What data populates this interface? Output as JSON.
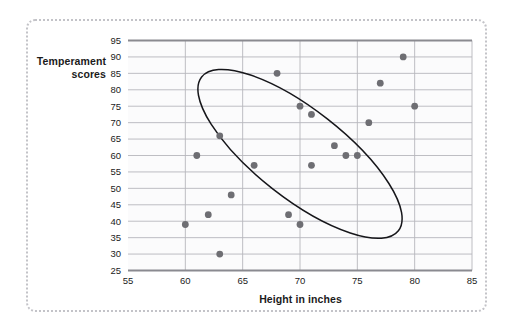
{
  "figure": {
    "background_color": "#ffffff",
    "frame_border_color": "#c3c3c8"
  },
  "chart_data": {
    "type": "scatter",
    "title": "",
    "xlabel": "Height in inches",
    "ylabel": "Temperament scores",
    "xlim": [
      55,
      85
    ],
    "ylim": [
      25,
      95
    ],
    "xticks": [
      55,
      60,
      65,
      70,
      75,
      80,
      85
    ],
    "yticks": [
      25,
      30,
      35,
      40,
      45,
      50,
      55,
      60,
      65,
      70,
      75,
      80,
      85,
      90,
      95
    ],
    "grid": "horizontal-and-vertical",
    "legend": "none",
    "point_color": "#6e6e73",
    "point_radius": 3.4,
    "gridline_color": "#b7b7bc",
    "axis_line_color": "#8a8a90",
    "points": [
      {
        "x": 60,
        "y": 39
      },
      {
        "x": 61,
        "y": 60
      },
      {
        "x": 62,
        "y": 42
      },
      {
        "x": 63,
        "y": 30
      },
      {
        "x": 63,
        "y": 66
      },
      {
        "x": 64,
        "y": 48
      },
      {
        "x": 66,
        "y": 57
      },
      {
        "x": 68,
        "y": 85
      },
      {
        "x": 69,
        "y": 42
      },
      {
        "x": 70,
        "y": 39
      },
      {
        "x": 70,
        "y": 75
      },
      {
        "x": 71,
        "y": 57
      },
      {
        "x": 71,
        "y": 72.5
      },
      {
        "x": 73,
        "y": 63
      },
      {
        "x": 74,
        "y": 60
      },
      {
        "x": 75,
        "y": 60
      },
      {
        "x": 76,
        "y": 70
      },
      {
        "x": 77,
        "y": 82
      },
      {
        "x": 79,
        "y": 90
      },
      {
        "x": 80,
        "y": 75
      }
    ],
    "annotations": [
      {
        "type": "ellipse",
        "name": "correlation-ellipse",
        "center_x": 70,
        "center_y": 60.5,
        "semi_major": 38,
        "semi_minor": 13.5,
        "rotation_deg": -52,
        "stroke": "#16161a",
        "fill": "none"
      }
    ]
  }
}
